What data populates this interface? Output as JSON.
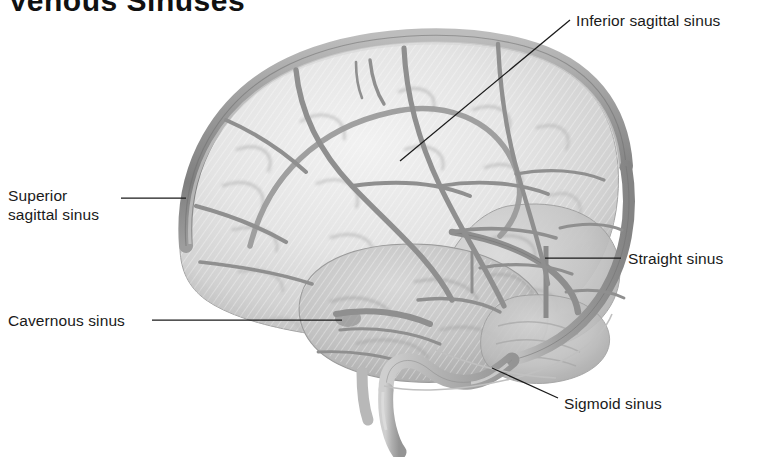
{
  "figure": {
    "title": "Venous Sinuses",
    "title_note": "clipped at top of image",
    "view": "lateral view of the brain showing dural venous sinuses",
    "style": "grayscale medical illustration",
    "background_color": "#ffffff",
    "ink_color": "#1a1a1a",
    "vessel_color": "#8c8c8c",
    "brain_light": "#e9e9e9",
    "brain_mid": "#d2d2d2",
    "brain_dark": "#b4b4b4"
  },
  "labels": [
    {
      "id": "inferior-sagittal-sinus",
      "text": "Inferior sagittal sinus",
      "lines": [
        "Inferior sagittal sinus"
      ],
      "text_x": 576,
      "text_y": 11,
      "leader": {
        "from_x": 570,
        "from_y": 20,
        "to_x": 400,
        "to_y": 161
      }
    },
    {
      "id": "superior-sagittal-sinus",
      "text": "Superior sagittal sinus",
      "lines": [
        "Superior",
        "sagittal sinus"
      ],
      "text_x": 8,
      "text_y": 186,
      "leader": {
        "from_x": 121,
        "from_y": 198,
        "to_x": 186,
        "to_y": 198
      }
    },
    {
      "id": "straight-sinus",
      "text": "Straight sinus",
      "lines": [
        "Straight sinus"
      ],
      "text_x": 628,
      "text_y": 249,
      "leader": {
        "from_x": 621,
        "from_y": 258,
        "to_x": 545,
        "to_y": 258
      }
    },
    {
      "id": "cavernous-sinus",
      "text": "Cavernous sinus",
      "lines": [
        "Cavernous sinus"
      ],
      "text_x": 8,
      "text_y": 311,
      "leader": {
        "from_x": 152,
        "from_y": 320,
        "to_x": 342,
        "to_y": 320
      }
    },
    {
      "id": "sigmoid-sinus",
      "text": "Sigmoid sinus",
      "lines": [
        "Sigmoid sinus"
      ],
      "text_x": 564,
      "text_y": 394,
      "leader": {
        "from_x": 558,
        "from_y": 398,
        "to_x": 492,
        "to_y": 368
      }
    }
  ],
  "structures": [
    "superior sagittal sinus",
    "inferior sagittal sinus",
    "straight sinus",
    "cavernous sinus",
    "sigmoid sinus",
    "transverse sinus",
    "internal jugular vein",
    "cerebral cortex",
    "temporal lobe",
    "cerebellum",
    "brainstem",
    "superficial cerebral veins"
  ]
}
